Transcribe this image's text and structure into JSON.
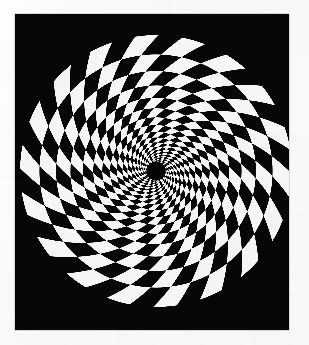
{
  "image": {
    "title": "Spiral checkerboard optical illusion",
    "description": "Black-and-white logarithmic spiral checkerboard disc printed on a black rectangular plate, photographed on off-white paper.",
    "width": 309,
    "height": 345,
    "caption": ""
  },
  "colors": {
    "paper": "#fbfbfa",
    "plate_black": "#070707",
    "check_white": "#f6f6f4",
    "check_black": "#060606",
    "plate_edge": "#828282"
  },
  "plate": {
    "name": "black-plate",
    "x": 15,
    "y": 14,
    "width": 274,
    "height": 316
  },
  "figure": {
    "name": "spiral-checkerboard-disc",
    "center_x": 156,
    "center_y": 171,
    "outer_radius": 136,
    "inner_hub_radius": 9,
    "angular_sectors": 36,
    "radial_rings": 17,
    "spiral_twist_turns": 0.42,
    "growth_ratio": 1.165,
    "parity_offset": 0
  },
  "chart_data": {
    "type": "polar-checkerboard",
    "center": [
      156,
      171
    ],
    "outer_radius": 136,
    "inner_radius": 9,
    "angular_sectors": 36,
    "sector_degrees": 10,
    "rings": 17,
    "ring_growth_ratio": 1.165,
    "twist_degrees_total": 151,
    "twist_direction": "counterclockwise-outward",
    "fill_colors": [
      "#f6f6f4",
      "#060606"
    ],
    "background": "#070707",
    "grid": false,
    "legend": false,
    "xlabel": "",
    "ylabel": ""
  }
}
